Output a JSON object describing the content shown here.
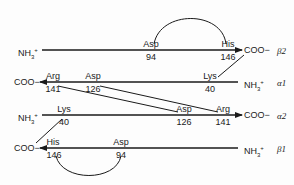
{
  "diagram": {
    "type": "hemoglobin-salt-bridge-diagram",
    "line_color": "#1a1a1a",
    "chains": [
      {
        "id": "beta2",
        "greek_label": "β2",
        "left_terminus": "NH3+",
        "right_terminus": "COO−",
        "direction": "right",
        "residues": [
          {
            "name": "Asp",
            "number": "94"
          },
          {
            "name": "His",
            "number": "146"
          }
        ]
      },
      {
        "id": "alpha1",
        "greek_label": "α1",
        "left_terminus": "COO−",
        "right_terminus": "NH3+",
        "direction": "left",
        "residues": [
          {
            "name": "Arg",
            "number": "141"
          },
          {
            "name": "Asp",
            "number": "126"
          },
          {
            "name": "Lys",
            "number": "40"
          }
        ]
      },
      {
        "id": "alpha2",
        "greek_label": "α2",
        "left_terminus": "NH3+",
        "right_terminus": "COO−",
        "direction": "right",
        "residues": [
          {
            "name": "Lys",
            "number": "40"
          },
          {
            "name": "Asp",
            "number": "126"
          },
          {
            "name": "Arg",
            "number": "141"
          }
        ]
      },
      {
        "id": "beta1",
        "greek_label": "β1",
        "left_terminus": "COO−",
        "right_terminus": "NH3+",
        "direction": "left",
        "residues": [
          {
            "name": "His",
            "number": "146"
          },
          {
            "name": "Asp",
            "number": "94"
          }
        ]
      }
    ],
    "connections": [
      {
        "from": "β2 Asp 94",
        "to": "β2 His 146",
        "kind": "intrachain-arc"
      },
      {
        "from": "β2 His 146 COO−",
        "to": "α1 Lys 40",
        "kind": "interchain"
      },
      {
        "from": "α1 Arg 141",
        "to": "α2 Asp 126",
        "kind": "interchain"
      },
      {
        "from": "α1 Asp 126",
        "to": "α2 Arg 141",
        "kind": "interchain"
      },
      {
        "from": "α2 Lys 40",
        "to": "β1 His 146 COO−",
        "kind": "interchain"
      },
      {
        "from": "β1 His 146",
        "to": "β1 Asp 94",
        "kind": "intrachain-arc"
      }
    ]
  }
}
